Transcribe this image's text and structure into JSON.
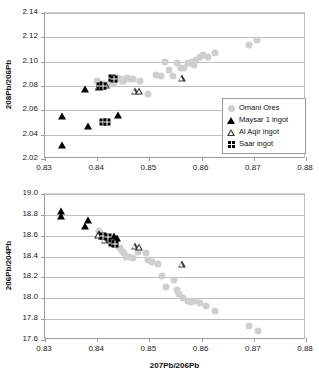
{
  "figure": {
    "background": "#ffffff",
    "ore_color": "#cfcfcf",
    "ingot_color": "#000000"
  },
  "legend": {
    "position": "inside-top-chart-bottom-right",
    "entries": [
      {
        "label": "Omani Ores",
        "marker": "gray-circle-icon"
      },
      {
        "label": "Maysar 1 ingot",
        "marker": "filled-triangle-icon"
      },
      {
        "label": "Al Aqir ingot",
        "marker": "open-triangle-icon"
      },
      {
        "label": "Saar ingot",
        "marker": "waffle-square-icon"
      }
    ]
  },
  "chart_data": [
    {
      "type": "scatter",
      "title": "",
      "xlabel": "",
      "ylabel": "208Pb/206Pb",
      "xlim": [
        0.83,
        0.88
      ],
      "ylim": [
        2.02,
        2.14
      ],
      "xticks": [
        "0.83",
        "0.84",
        "0.85",
        "0.86",
        "0.87",
        "0.88"
      ],
      "xtick_values": [
        0.83,
        0.84,
        0.85,
        0.86,
        0.87,
        0.88
      ],
      "yticks": [
        "2.02",
        "2.04",
        "2.06",
        "2.08",
        "2.10",
        "2.12",
        "2.14"
      ],
      "ytick_values": [
        2.02,
        2.04,
        2.06,
        2.08,
        2.1,
        2.12,
        2.14
      ],
      "grid": "horizontal",
      "legend": "bottom-right",
      "series": [
        {
          "name": "Omani Ores",
          "marker": "gray-circle",
          "color": "#cfcfcf",
          "points": [
            [
              0.8399,
              2.0845
            ],
            [
              0.8405,
              2.0815
            ],
            [
              0.8412,
              2.0818
            ],
            [
              0.8424,
              2.0826
            ],
            [
              0.8432,
              2.0822
            ],
            [
              0.844,
              2.0863
            ],
            [
              0.8445,
              2.0858
            ],
            [
              0.8448,
              2.084
            ],
            [
              0.8452,
              2.0838
            ],
            [
              0.8457,
              2.0862
            ],
            [
              0.8462,
              2.0855
            ],
            [
              0.8468,
              2.086
            ],
            [
              0.8482,
              2.0845
            ],
            [
              0.8497,
              2.0738
            ],
            [
              0.8512,
              2.089
            ],
            [
              0.8522,
              2.0884
            ],
            [
              0.853,
              2.0998
            ],
            [
              0.8538,
              2.093
            ],
            [
              0.8546,
              2.0886
            ],
            [
              0.8553,
              2.0992
            ],
            [
              0.8561,
              2.0952
            ],
            [
              0.8566,
              2.0948
            ],
            [
              0.8574,
              2.099
            ],
            [
              0.8578,
              2.0985
            ],
            [
              0.8582,
              2.1
            ],
            [
              0.8586,
              2.0975
            ],
            [
              0.859,
              2.101
            ],
            [
              0.8596,
              2.1042
            ],
            [
              0.8602,
              2.1055
            ],
            [
              0.8612,
              2.1038
            ],
            [
              0.8626,
              2.107
            ],
            [
              0.8691,
              2.114
            ],
            [
              0.8707,
              2.1178
            ]
          ]
        },
        {
          "name": "Maysar 1 ingot",
          "marker": "filled-triangle",
          "color": "#000000",
          "points": [
            [
              0.8332,
              2.0552
            ],
            [
              0.8332,
              2.0315
            ],
            [
              0.8377,
              2.0775
            ],
            [
              0.8383,
              2.0468
            ],
            [
              0.8404,
              2.0795
            ],
            [
              0.8408,
              2.0818
            ],
            [
              0.841,
              2.08
            ],
            [
              0.8439,
              2.056
            ]
          ]
        },
        {
          "name": "Al Aqir ingot",
          "marker": "open-triangle",
          "color": "#3a3a3a",
          "points": [
            [
              0.8403,
              2.08
            ],
            [
              0.8417,
              2.0806
            ],
            [
              0.8472,
              2.0762
            ],
            [
              0.8481,
              2.0758
            ],
            [
              0.8562,
              2.0868
            ]
          ]
        },
        {
          "name": "Saar ingot",
          "marker": "waffle-square",
          "color": "#000000",
          "points": [
            [
              0.8406,
              2.08
            ],
            [
              0.8412,
              2.0798
            ],
            [
              0.8428,
              2.0862
            ],
            [
              0.8433,
              2.086
            ],
            [
              0.8412,
              2.0508
            ],
            [
              0.8418,
              2.0505
            ]
          ]
        }
      ]
    },
    {
      "type": "scatter",
      "title": "",
      "xlabel": "207Pb/206Pb",
      "ylabel": "206Pb/204Pb",
      "xlim": [
        0.83,
        0.88
      ],
      "ylim": [
        17.6,
        19.0
      ],
      "xticks": [
        "0.83",
        "0.84",
        "0.85",
        "0.86",
        "0.87",
        "0.88"
      ],
      "xtick_values": [
        0.83,
        0.84,
        0.85,
        0.86,
        0.87,
        0.88
      ],
      "yticks": [
        "17.6",
        "17.8",
        "18.0",
        "18.2",
        "18.4",
        "18.6",
        "18.8",
        "19.0"
      ],
      "ytick_values": [
        17.6,
        17.8,
        18.0,
        18.2,
        18.4,
        18.6,
        18.8,
        19.0
      ],
      "grid": "horizontal",
      "legend": "none",
      "series": [
        {
          "name": "Omani Ores",
          "marker": "gray-circle",
          "color": "#cfcfcf",
          "points": [
            [
              0.8403,
              18.645
            ],
            [
              0.8408,
              18.62
            ],
            [
              0.8418,
              18.575
            ],
            [
              0.8428,
              18.56
            ],
            [
              0.8436,
              18.51
            ],
            [
              0.8443,
              18.48
            ],
            [
              0.8447,
              18.455
            ],
            [
              0.8452,
              18.43
            ],
            [
              0.8456,
              18.4
            ],
            [
              0.846,
              18.395
            ],
            [
              0.8468,
              18.39
            ],
            [
              0.8478,
              18.44
            ],
            [
              0.8494,
              18.435
            ],
            [
              0.8497,
              18.37
            ],
            [
              0.8505,
              18.345
            ],
            [
              0.8516,
              18.33
            ],
            [
              0.8525,
              18.215
            ],
            [
              0.8532,
              18.105
            ],
            [
              0.8548,
              18.18
            ],
            [
              0.8553,
              18.075
            ],
            [
              0.8556,
              18.04
            ],
            [
              0.8564,
              18.0
            ],
            [
              0.8574,
              17.97
            ],
            [
              0.858,
              17.965
            ],
            [
              0.8588,
              17.975
            ],
            [
              0.8596,
              17.955
            ],
            [
              0.8608,
              17.93
            ],
            [
              0.8626,
              17.88
            ],
            [
              0.869,
              17.735
            ],
            [
              0.8708,
              17.685
            ]
          ]
        },
        {
          "name": "Maysar 1 ingot",
          "marker": "filled-triangle",
          "color": "#000000",
          "points": [
            [
              0.8331,
              18.84
            ],
            [
              0.8331,
              18.79
            ],
            [
              0.8376,
              18.69
            ],
            [
              0.8382,
              18.755
            ],
            [
              0.8404,
              18.615
            ],
            [
              0.841,
              18.6
            ],
            [
              0.8432,
              18.6
            ],
            [
              0.8438,
              18.58
            ]
          ]
        },
        {
          "name": "Al Aqir ingot",
          "marker": "open-triangle",
          "color": "#3a3a3a",
          "points": [
            [
              0.8402,
              18.605
            ],
            [
              0.8414,
              18.555
            ],
            [
              0.8472,
              18.5
            ],
            [
              0.8481,
              18.49
            ],
            [
              0.8562,
              18.33
            ]
          ]
        },
        {
          "name": "Saar ingot",
          "marker": "waffle-square",
          "color": "#000000",
          "points": [
            [
              0.8412,
              18.6
            ],
            [
              0.8421,
              18.592
            ],
            [
              0.8428,
              18.53
            ],
            [
              0.8434,
              18.522
            ]
          ]
        }
      ]
    }
  ]
}
